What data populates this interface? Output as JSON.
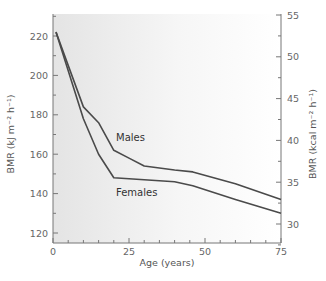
{
  "chart_data": {
    "type": "line",
    "title": "",
    "xlabel": "Age (years)",
    "ylabel": "BMR (kJ m⁻² h⁻¹)",
    "ylabel_right": "BMR (kcal m⁻² h⁻¹)",
    "xlim": [
      0,
      75
    ],
    "ylim": [
      115,
      232
    ],
    "ylim_right": [
      27.5,
      55.5
    ],
    "x_ticks": [
      0,
      25,
      50,
      75
    ],
    "y_ticks": [
      120,
      140,
      160,
      180,
      200,
      220
    ],
    "y_ticks_right": [
      30,
      35,
      40,
      45,
      50,
      55
    ],
    "grid": false,
    "legend": "inline labels",
    "series": [
      {
        "name": "Males",
        "x": [
          1,
          10,
          15,
          20,
          25,
          30,
          40,
          46,
          60,
          75
        ],
        "values": [
          222,
          184,
          176,
          162,
          158,
          154,
          152,
          151,
          145,
          137
        ]
      },
      {
        "name": "Females",
        "x": [
          1,
          10,
          15,
          20,
          30,
          40,
          46,
          60,
          75
        ],
        "values": [
          222,
          178,
          160,
          148,
          147,
          146,
          144,
          137,
          130
        ]
      }
    ],
    "colors": {
      "line": "#4a4a4a",
      "axis": "#777777",
      "bg_left": "#e6e6e6",
      "bg_right": "#ffffff"
    }
  },
  "labels": {
    "x_axis_title": "Age (years)",
    "y_axis_left_title": "BMR (kJ m⁻² h⁻¹)",
    "y_axis_right_title": "BMR (kcal m⁻² h⁻¹)",
    "males": "Males",
    "females": "Females",
    "x_ticks": [
      "0",
      "25",
      "50",
      "75"
    ],
    "y_ticks_left": [
      "120",
      "140",
      "160",
      "180",
      "200",
      "220"
    ],
    "y_ticks_right": [
      "30",
      "35",
      "40",
      "45",
      "50",
      "55"
    ]
  }
}
